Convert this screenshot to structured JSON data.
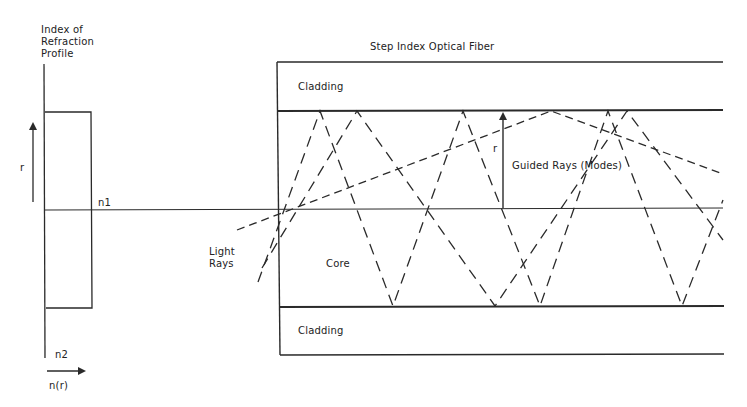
{
  "profile": {
    "title": "Index of\nRefraction\nProfile",
    "axis_r_label": "r",
    "axis_n_label": "n(r)",
    "n1_label": "n1",
    "n2_label": "n2"
  },
  "fiber": {
    "title": "Step Index Optical Fiber",
    "cladding_top_label": "Cladding",
    "cladding_bottom_label": "Cladding",
    "core_label": "Core",
    "radius_label": "r",
    "guided_rays_label": "Guided Rays (Modes)",
    "light_rays_label": "Light\nRays"
  },
  "colors": {
    "line": "#2a2a2a",
    "background": "#ffffff"
  }
}
